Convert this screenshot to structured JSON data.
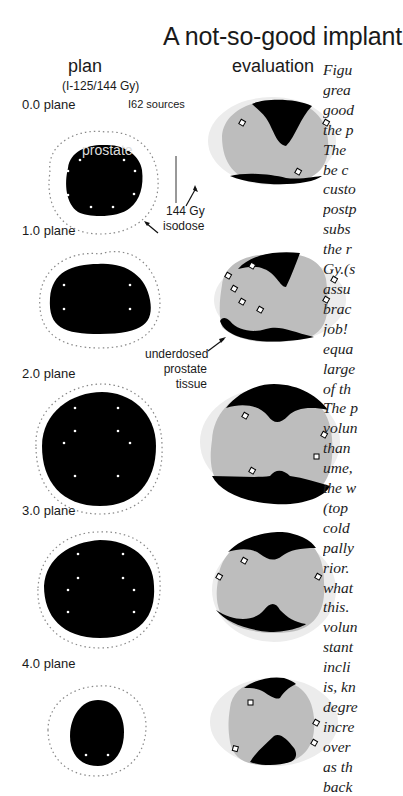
{
  "title": "A not-so-good implant",
  "columns": {
    "plan": {
      "label": "plan",
      "sublabel": "(I-125/144 Gy)"
    },
    "evaluation": {
      "label": "evaluation"
    }
  },
  "annotations": {
    "sources": "I62 sources",
    "prostate": "prostate",
    "isodose_line1": "144 Gy",
    "isodose_line2": "isodose",
    "underdosed_line1": "underdosed",
    "underdosed_line2": "prostate",
    "underdosed_line3": "tissue"
  },
  "planes": [
    {
      "label": "0.0 plane"
    },
    {
      "label": "1.0 plane"
    },
    {
      "label": "2.0 plane"
    },
    {
      "label": "3.0 plane"
    },
    {
      "label": "4.0 plane"
    }
  ],
  "caption_lines": [
    "Figu",
    "grea",
    "good",
    "the p",
    "The",
    "be c",
    "custo",
    "postp",
    "subs",
    "the r",
    "Gy.(s",
    "assu",
    "brac",
    "job!",
    "equa",
    "large",
    "of th",
    "The p",
    "volun",
    "than",
    "ume,",
    "the w",
    "(top",
    "cold",
    "pally",
    "rior.",
    "what",
    "this.",
    "volun",
    "stant",
    "incli",
    "is, kn",
    "degre",
    "incre",
    "over",
    "as th",
    "back"
  ],
  "colors": {
    "prostate_fill": "#000000",
    "isodose_fill": "#bdbdbd",
    "halo_fill": "#ececec",
    "isodose_dots": "#888888",
    "seed_fill": "#ffffff"
  }
}
